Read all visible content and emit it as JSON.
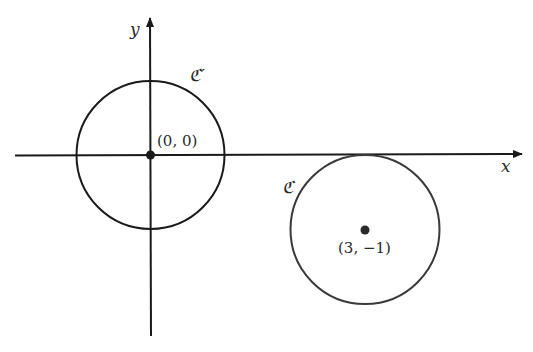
{
  "diagram": {
    "type": "coordinate-plane-circles",
    "axes": {
      "x_label": "x",
      "y_label": "y",
      "color": "#1a1a1a"
    },
    "circles": [
      {
        "name": "C'",
        "label": "ℭ′",
        "center_label": "(0, 0)",
        "center": [
          0,
          0
        ],
        "color": "#1a1a1a"
      },
      {
        "name": "C",
        "label": "ℭ",
        "center_label": "(3, −1)",
        "center": [
          3,
          -1
        ],
        "color": "#3a3a3a"
      }
    ]
  }
}
